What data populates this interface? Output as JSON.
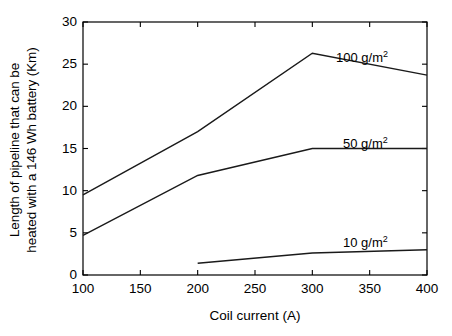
{
  "chart_data": {
    "type": "line",
    "title": "",
    "xlabel": "Coil current (A)",
    "ylabel": "Length of pipeline that can be heated with a 146 Wh battery (Km)",
    "ylabel_lines": [
      "Length of pipeline that can be",
      "heated with a 146 Wh battery (Km)"
    ],
    "xlim": [
      100,
      400
    ],
    "ylim": [
      0,
      30
    ],
    "xticks": [
      100,
      150,
      200,
      250,
      300,
      350,
      400
    ],
    "xtick_labels": [
      "100",
      "150",
      "200",
      "250",
      "300",
      "350",
      "400"
    ],
    "yticks": [
      0,
      5,
      10,
      15,
      20,
      25,
      30
    ],
    "ytick_labels": [
      "0",
      "5",
      "10",
      "15",
      "20",
      "25",
      "30"
    ],
    "grid": false,
    "legend_position": "inline-annotations",
    "line_color": "#1a1a1a",
    "axis_color": "#000000",
    "background": "#ffffff",
    "series": [
      {
        "name": "100 g/m2",
        "label_text": "100 g/m",
        "label_sup": "2",
        "label_x": 336,
        "label_y": 48,
        "x": [
          100,
          200,
          300,
          400
        ],
        "values": [
          9.5,
          17.0,
          26.3,
          23.7
        ]
      },
      {
        "name": "50 g/m2",
        "label_text": "50 g/m",
        "label_sup": "2",
        "label_x": 343,
        "label_y": 134,
        "x": [
          100,
          200,
          300,
          400
        ],
        "values": [
          4.7,
          11.8,
          15.0,
          15.0
        ]
      },
      {
        "name": "10 g/m2",
        "label_text": "10 g/m",
        "label_sup": "2",
        "label_x": 343,
        "label_y": 233,
        "x": [
          200,
          300,
          400
        ],
        "values": [
          1.4,
          2.6,
          3.0
        ]
      }
    ]
  }
}
